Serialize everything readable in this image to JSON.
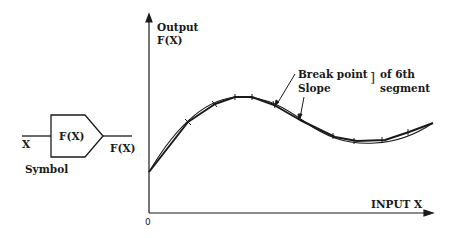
{
  "symbol": {
    "input_label": "X",
    "block_label": "F(X)",
    "output_label": "F(X)",
    "caption": "Symbol"
  },
  "graph": {
    "y_axis_label_line1": "Output",
    "y_axis_label_line2": "F(X)",
    "x_axis_label": "INPUT X",
    "origin_label": "0",
    "annotation_line1": "Break point",
    "annotation_line2": "Slope",
    "annotation_bracket": "]",
    "annotation_suffix_line1": "of 6th",
    "annotation_suffix_line2": "segment"
  },
  "colors": {
    "ink": "#1a1a1a",
    "background": "#ffffff"
  }
}
